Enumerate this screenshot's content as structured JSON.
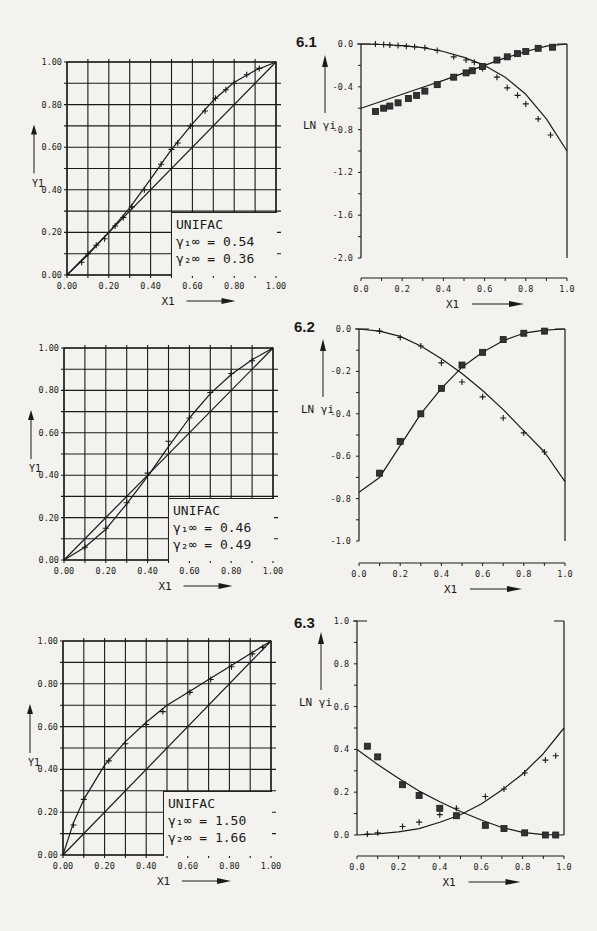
{
  "figures": [
    {
      "label": "6.1",
      "unifac": {
        "title": "UNIFAC",
        "g1_label": "γ₁∞ =",
        "g1_value": "0.54",
        "g2_label": "γ₂∞ =",
        "g2_value": "0.36"
      }
    },
    {
      "label": "6.2",
      "unifac": {
        "title": "UNIFAC",
        "g1_label": "γ₁∞ =",
        "g1_value": "0.46",
        "g2_label": "γ₂∞ =",
        "g2_value": "0.49"
      }
    },
    {
      "label": "6.3",
      "unifac": {
        "title": "UNIFAC",
        "g1_label": "γ₁∞ =",
        "g1_value": "1.50",
        "g2_label": "γ₂∞ =",
        "g2_value": "1.66"
      }
    }
  ],
  "chart_data": [
    {
      "id": "6.1-xy",
      "type": "line",
      "title": "",
      "xlabel": "X1",
      "ylabel": "Y1",
      "xlim": [
        0,
        1
      ],
      "ylim": [
        0,
        1
      ],
      "grid": true,
      "xticks": [
        "0.00",
        "0.20",
        "0.40",
        "0.60",
        "0.80",
        "1.00"
      ],
      "yticks": [
        "0.00",
        "0.20",
        "0.40",
        "0.60",
        "0.80",
        "1.00"
      ],
      "series": [
        {
          "name": "UNIFAC curve",
          "style": "line",
          "x": [
            0,
            0.1,
            0.2,
            0.3,
            0.4,
            0.5,
            0.6,
            0.7,
            0.8,
            0.9,
            1.0
          ],
          "y": [
            0,
            0.095,
            0.2,
            0.315,
            0.45,
            0.59,
            0.71,
            0.82,
            0.905,
            0.96,
            1.0
          ]
        },
        {
          "name": "diagonal",
          "style": "line",
          "x": [
            0,
            1
          ],
          "y": [
            0,
            1
          ]
        },
        {
          "name": "experimental",
          "style": "plus",
          "x": [
            0.07,
            0.1,
            0.14,
            0.18,
            0.23,
            0.27,
            0.31,
            0.37,
            0.45,
            0.5,
            0.53,
            0.59,
            0.66,
            0.71,
            0.76,
            0.8,
            0.86,
            0.92
          ],
          "y": [
            0.06,
            0.1,
            0.14,
            0.17,
            0.23,
            0.27,
            0.32,
            0.4,
            0.52,
            0.59,
            0.62,
            0.7,
            0.77,
            0.83,
            0.87,
            0.9,
            0.94,
            0.97
          ]
        }
      ]
    },
    {
      "id": "6.1-ln",
      "type": "line",
      "xlabel": "X1",
      "ylabel": "LN γi",
      "xlim": [
        0,
        1
      ],
      "ylim": [
        -2.0,
        0.0
      ],
      "grid": false,
      "xticks": [
        "0.0",
        "0.2",
        "0.4",
        "0.6",
        "0.8",
        "1.0"
      ],
      "yticks": [
        "0.0",
        "-0.4",
        "-0.8",
        "-1.2",
        "-1.6",
        "-2.0"
      ],
      "series": [
        {
          "name": "ln γ1 UNIFAC",
          "style": "line",
          "x": [
            0,
            0.1,
            0.2,
            0.3,
            0.4,
            0.5,
            0.6,
            0.7,
            0.8,
            0.9,
            1.0
          ],
          "y": [
            0,
            -0.005,
            -0.015,
            -0.035,
            -0.07,
            -0.125,
            -0.2,
            -0.31,
            -0.47,
            -0.7,
            -1.0
          ]
        },
        {
          "name": "ln γ2 UNIFAC",
          "style": "line",
          "x": [
            0,
            0.1,
            0.2,
            0.3,
            0.4,
            0.5,
            0.6,
            0.7,
            0.8,
            0.9,
            1.0
          ],
          "y": [
            -0.6,
            -0.535,
            -0.47,
            -0.405,
            -0.34,
            -0.27,
            -0.2,
            -0.13,
            -0.07,
            -0.02,
            0
          ]
        },
        {
          "name": "ln γ1 exp",
          "style": "plus",
          "x": [
            0.07,
            0.11,
            0.14,
            0.18,
            0.22,
            0.26,
            0.31,
            0.37,
            0.45,
            0.51,
            0.55,
            0.59,
            0.66,
            0.71,
            0.76,
            0.8,
            0.86,
            0.92
          ],
          "y": [
            0,
            -0.005,
            -0.01,
            -0.015,
            -0.02,
            -0.025,
            -0.035,
            -0.06,
            -0.12,
            -0.15,
            -0.17,
            -0.23,
            -0.31,
            -0.41,
            -0.48,
            -0.56,
            -0.7,
            -0.85
          ]
        },
        {
          "name": "ln γ2 exp",
          "style": "star",
          "x": [
            0.07,
            0.11,
            0.14,
            0.18,
            0.23,
            0.27,
            0.31,
            0.37,
            0.45,
            0.51,
            0.54,
            0.59,
            0.66,
            0.71,
            0.76,
            0.8,
            0.86,
            0.93
          ],
          "y": [
            -0.63,
            -0.6,
            -0.58,
            -0.55,
            -0.51,
            -0.48,
            -0.44,
            -0.38,
            -0.31,
            -0.27,
            -0.25,
            -0.21,
            -0.15,
            -0.12,
            -0.09,
            -0.07,
            -0.04,
            -0.03
          ]
        }
      ]
    },
    {
      "id": "6.2-xy",
      "type": "line",
      "xlabel": "X1",
      "ylabel": "Y1",
      "xlim": [
        0,
        1
      ],
      "ylim": [
        0,
        1
      ],
      "grid": true,
      "xticks": [
        "0.00",
        "0.20",
        "0.40",
        "0.60",
        "0.80",
        "1.00"
      ],
      "yticks": [
        "0.00",
        "0.20",
        "0.40",
        "0.60",
        "0.80",
        "1.00"
      ],
      "series": [
        {
          "name": "UNIFAC curve",
          "style": "line",
          "x": [
            0,
            0.1,
            0.2,
            0.3,
            0.4,
            0.5,
            0.6,
            0.7,
            0.8,
            0.9,
            1.0
          ],
          "y": [
            0,
            0.06,
            0.145,
            0.265,
            0.395,
            0.535,
            0.67,
            0.785,
            0.875,
            0.945,
            1.0
          ]
        },
        {
          "name": "diagonal",
          "style": "line",
          "x": [
            0,
            1
          ],
          "y": [
            0,
            1
          ]
        },
        {
          "name": "experimental",
          "style": "plus",
          "x": [
            0.1,
            0.2,
            0.3,
            0.4,
            0.5,
            0.6,
            0.7,
            0.8,
            0.9
          ],
          "y": [
            0.06,
            0.15,
            0.27,
            0.41,
            0.56,
            0.67,
            0.79,
            0.88,
            0.94
          ]
        }
      ]
    },
    {
      "id": "6.2-ln",
      "type": "line",
      "xlabel": "X1",
      "ylabel": "LN γi",
      "xlim": [
        0,
        1
      ],
      "ylim": [
        -1.0,
        0.0
      ],
      "grid": false,
      "xticks": [
        "0.0",
        "0.2",
        "0.4",
        "0.6",
        "0.8",
        "1.0"
      ],
      "yticks": [
        "0.0",
        "-0.2",
        "-0.4",
        "-0.6",
        "-0.8",
        "-1.0"
      ],
      "series": [
        {
          "name": "ln γ1 UNIFAC",
          "style": "line",
          "x": [
            0,
            0.1,
            0.2,
            0.3,
            0.4,
            0.5,
            0.6,
            0.7,
            0.8,
            0.9,
            1.0
          ],
          "y": [
            0,
            -0.01,
            -0.035,
            -0.08,
            -0.14,
            -0.21,
            -0.29,
            -0.38,
            -0.48,
            -0.58,
            -0.72
          ]
        },
        {
          "name": "ln γ2 UNIFAC",
          "style": "line",
          "x": [
            0,
            0.1,
            0.2,
            0.3,
            0.4,
            0.5,
            0.6,
            0.7,
            0.8,
            0.9,
            1.0
          ],
          "y": [
            -0.77,
            -0.7,
            -0.55,
            -0.4,
            -0.28,
            -0.18,
            -0.11,
            -0.055,
            -0.02,
            -0.005,
            0
          ]
        },
        {
          "name": "ln γ1 exp",
          "style": "plus",
          "x": [
            0.1,
            0.2,
            0.3,
            0.4,
            0.5,
            0.6,
            0.7,
            0.8,
            0.9
          ],
          "y": [
            -0.01,
            -0.04,
            -0.08,
            -0.16,
            -0.25,
            -0.32,
            -0.42,
            -0.49,
            -0.58
          ]
        },
        {
          "name": "ln γ2 exp",
          "style": "star",
          "x": [
            0.1,
            0.2,
            0.3,
            0.4,
            0.5,
            0.6,
            0.7,
            0.8,
            0.9
          ],
          "y": [
            -0.68,
            -0.53,
            -0.4,
            -0.28,
            -0.17,
            -0.11,
            -0.05,
            -0.02,
            -0.01
          ]
        }
      ]
    },
    {
      "id": "6.3-xy",
      "type": "line",
      "xlabel": "X1",
      "ylabel": "Y1",
      "xlim": [
        0,
        1
      ],
      "ylim": [
        0,
        1
      ],
      "grid": true,
      "xticks": [
        "0.00",
        "0.20",
        "0.40",
        "0.60",
        "0.80",
        "1.00"
      ],
      "yticks": [
        "0.00",
        "0.20",
        "0.40",
        "0.60",
        "0.80",
        "1.00"
      ],
      "series": [
        {
          "name": "UNIFAC curve",
          "style": "line",
          "x": [
            0,
            0.05,
            0.1,
            0.2,
            0.3,
            0.4,
            0.5,
            0.6,
            0.7,
            0.8,
            0.9,
            1.0
          ],
          "y": [
            0,
            0.15,
            0.26,
            0.42,
            0.53,
            0.62,
            0.7,
            0.76,
            0.82,
            0.88,
            0.94,
            1.0
          ]
        },
        {
          "name": "diagonal",
          "style": "line",
          "x": [
            0,
            1
          ],
          "y": [
            0,
            1
          ]
        },
        {
          "name": "experimental",
          "style": "plus",
          "x": [
            0.05,
            0.1,
            0.22,
            0.3,
            0.4,
            0.48,
            0.61,
            0.71,
            0.81,
            0.91,
            0.96
          ],
          "y": [
            0.14,
            0.26,
            0.44,
            0.52,
            0.61,
            0.67,
            0.76,
            0.82,
            0.88,
            0.94,
            0.97
          ]
        }
      ]
    },
    {
      "id": "6.3-ln",
      "type": "line",
      "xlabel": "X1",
      "ylabel": "LN γi",
      "xlim": [
        0,
        1
      ],
      "ylim": [
        0.0,
        1.0
      ],
      "grid": false,
      "xticks": [
        "0.0",
        "0.2",
        "0.4",
        "0.6",
        "0.8",
        "1.0"
      ],
      "yticks": [
        "0.0",
        "0.2",
        "0.4",
        "0.6",
        "0.8",
        "1.0"
      ],
      "series": [
        {
          "name": "ln γ1 UNIFAC",
          "style": "line",
          "x": [
            0,
            0.1,
            0.2,
            0.3,
            0.4,
            0.5,
            0.6,
            0.7,
            0.8,
            0.9,
            1.0
          ],
          "y": [
            0,
            0.005,
            0.015,
            0.03,
            0.06,
            0.095,
            0.145,
            0.21,
            0.285,
            0.38,
            0.5
          ]
        },
        {
          "name": "ln γ2 UNIFAC",
          "style": "line",
          "x": [
            0,
            0.1,
            0.2,
            0.3,
            0.4,
            0.5,
            0.6,
            0.7,
            0.8,
            0.9,
            1.0
          ],
          "y": [
            0.4,
            0.33,
            0.265,
            0.205,
            0.155,
            0.11,
            0.07,
            0.035,
            0.012,
            0.002,
            0
          ]
        },
        {
          "name": "ln γ1 exp",
          "style": "plus",
          "x": [
            0.05,
            0.1,
            0.22,
            0.3,
            0.4,
            0.48,
            0.62,
            0.71,
            0.81,
            0.91,
            0.96
          ],
          "y": [
            0.005,
            0.01,
            0.04,
            0.06,
            0.095,
            0.125,
            0.18,
            0.215,
            0.29,
            0.35,
            0.37
          ]
        },
        {
          "name": "ln γ2 exp",
          "style": "star",
          "x": [
            0.05,
            0.1,
            0.22,
            0.3,
            0.4,
            0.48,
            0.62,
            0.71,
            0.81,
            0.91,
            0.96
          ],
          "y": [
            0.415,
            0.365,
            0.235,
            0.185,
            0.125,
            0.09,
            0.045,
            0.03,
            0.01,
            0,
            0
          ]
        }
      ]
    }
  ]
}
